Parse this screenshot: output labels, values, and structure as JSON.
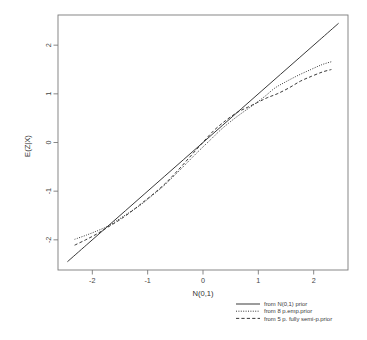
{
  "chart_data": {
    "type": "line",
    "title": "",
    "xlabel": "N(0,1)",
    "ylabel": "E(Z|X)",
    "xlim": [
      -2.62,
      2.62
    ],
    "ylim": [
      -2.62,
      2.62
    ],
    "xticks": [
      "-2",
      "-1",
      "0",
      "1",
      "2"
    ],
    "xtick_values": [
      -2,
      -1,
      0,
      1,
      2
    ],
    "yticks": [
      "-2",
      "-1",
      "0",
      "1",
      "2"
    ],
    "ytick_values": [
      -2,
      -1,
      0,
      1,
      2
    ],
    "grid": false,
    "legend_position": "below-right",
    "series": [
      {
        "name": "from N(0,1) prior",
        "style": "solid",
        "x": [
          -2.45,
          -2.1,
          -1.75,
          -1.4,
          -1.05,
          -0.7,
          -0.35,
          0.0,
          0.35,
          0.7,
          1.05,
          1.4,
          1.75,
          2.1,
          2.45
        ],
        "y": [
          -2.45,
          -2.1,
          -1.75,
          -1.4,
          -1.05,
          -0.7,
          -0.35,
          0.0,
          0.35,
          0.7,
          1.05,
          1.4,
          1.75,
          2.1,
          2.45
        ]
      },
      {
        "name": "from 8 p.emp.prior",
        "style": "dotted",
        "x": [
          -2.32,
          -2.1,
          -1.9,
          -1.72,
          -1.55,
          -1.35,
          -1.15,
          -0.95,
          -0.72,
          -0.5,
          -0.3,
          -0.1,
          0.12,
          0.32,
          0.52,
          0.72,
          0.92,
          1.12,
          1.3,
          1.5,
          1.72,
          1.95,
          2.15,
          2.32
        ],
        "y": [
          -1.99,
          -1.9,
          -1.81,
          -1.72,
          -1.6,
          -1.45,
          -1.3,
          -1.12,
          -0.9,
          -0.66,
          -0.43,
          -0.2,
          0.04,
          0.26,
          0.45,
          0.62,
          0.78,
          0.95,
          1.12,
          1.25,
          1.38,
          1.5,
          1.6,
          1.66
        ]
      },
      {
        "name": "from 5 p. fully semi-p.prior",
        "style": "dashed",
        "x": [
          -2.32,
          -2.12,
          -1.92,
          -1.72,
          -1.52,
          -1.32,
          -1.12,
          -0.9,
          -0.68,
          -0.46,
          -0.24,
          -0.02,
          0.2,
          0.42,
          0.62,
          0.8,
          0.98,
          1.16,
          1.34,
          1.55,
          1.76,
          1.96,
          2.16,
          2.32
        ],
        "y": [
          -2.11,
          -2.0,
          -1.88,
          -1.74,
          -1.6,
          -1.44,
          -1.26,
          -1.06,
          -0.84,
          -0.58,
          -0.3,
          -0.02,
          0.25,
          0.46,
          0.62,
          0.72,
          0.82,
          0.92,
          1.0,
          1.12,
          1.26,
          1.36,
          1.45,
          1.5
        ]
      }
    ]
  },
  "legend": {
    "entries": [
      {
        "label": "from N(0,1) prior",
        "style": "solid"
      },
      {
        "label": "from 8 p.emp.prior",
        "style": "dotted"
      },
      {
        "label": "from 5 p. fully semi-p.prior",
        "style": "dashed"
      }
    ]
  },
  "axes": {
    "x_title": "N(0,1)",
    "y_title": "E(Z|X)"
  }
}
